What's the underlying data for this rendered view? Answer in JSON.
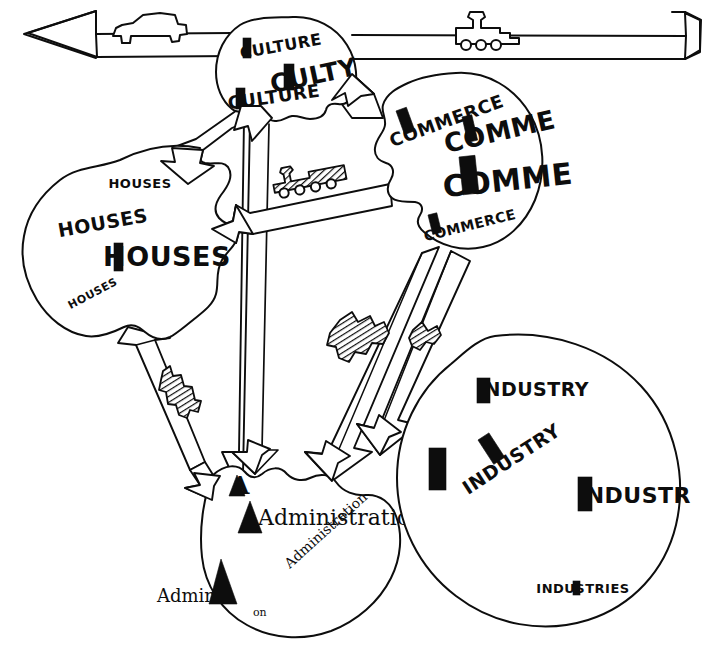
{
  "diagram": {
    "medium": "pen sketch",
    "background_color": "#ffffff",
    "ink_color": "#0d0d0d",
    "canvas": {
      "width": 706,
      "height": 666
    }
  },
  "transport_axis": {
    "name": "horizontal double-headed arrow band",
    "direction": "bidirectional",
    "left_arrow_label": "◀",
    "right_arrow_label": "▶",
    "vehicles": [
      {
        "id": "car",
        "icon": "car-icon",
        "label": "car",
        "position": "left"
      },
      {
        "id": "locomotive",
        "icon": "train-icon",
        "label": "locomotive",
        "position": "right"
      }
    ]
  },
  "zones": [
    {
      "id": "culture",
      "name": "Culture",
      "shape": "round blob",
      "labels": [
        {
          "text": "CULTURE",
          "size": "small"
        },
        {
          "text": "CULTY",
          "size": "large"
        },
        {
          "text": "CULTURE",
          "size": "medium"
        }
      ]
    },
    {
      "id": "commerce",
      "name": "Commerce",
      "shape": "round blob",
      "labels": [
        {
          "text": "COMMERCE",
          "size": "medium"
        },
        {
          "text": "COMME",
          "size": "large"
        },
        {
          "text": "COMME",
          "size": "xlarge"
        },
        {
          "text": "COMMERCE",
          "size": "small"
        }
      ]
    },
    {
      "id": "houses",
      "name": "Houses",
      "shape": "irregular blob",
      "labels": [
        {
          "text": "HOUSES",
          "size": "small"
        },
        {
          "text": "HOUSES",
          "size": "medium"
        },
        {
          "text": "HOUSES",
          "size": "large"
        },
        {
          "text": "HOUSES",
          "size": "xsmall"
        }
      ]
    },
    {
      "id": "administration",
      "name": "Administration",
      "shape": "round blob",
      "labels": [
        {
          "text": "A",
          "size": "medium"
        },
        {
          "text": "Administration",
          "size": "large"
        },
        {
          "text": "Administration",
          "size": "small"
        },
        {
          "text": "Adminis",
          "size": "medium"
        },
        {
          "text": "on",
          "size": "xsmall"
        }
      ]
    },
    {
      "id": "industry",
      "name": "Industry",
      "shape": "large round blob",
      "labels": [
        {
          "text": "INDUSTRY",
          "size": "medium"
        },
        {
          "text": "INDUSTRY",
          "size": "medium"
        },
        {
          "text": "INDUSTR",
          "size": "large"
        },
        {
          "text": "INDUSTRIES",
          "size": "small"
        }
      ]
    }
  ],
  "corridors": [
    {
      "id": "houses-culture",
      "from": "houses",
      "to": "culture",
      "arrow": "both",
      "vehicle": null
    },
    {
      "id": "culture-commerce",
      "from": "culture",
      "to": "commerce",
      "arrow": "both",
      "vehicle": null
    },
    {
      "id": "houses-commerce",
      "from": "houses",
      "to": "commerce",
      "arrow": "left",
      "vehicle": "train-hatched"
    },
    {
      "id": "culture-administration",
      "from": "culture",
      "to": "administration",
      "arrow": "down",
      "vehicle": null
    },
    {
      "id": "houses-administration",
      "from": "houses",
      "to": "administration",
      "arrow": "both",
      "vehicle": "truck-hatched"
    },
    {
      "id": "commerce-administration",
      "from": "commerce",
      "to": "administration",
      "arrow": "down",
      "vehicle": "truck-hatched"
    },
    {
      "id": "commerce-industry",
      "from": "commerce",
      "to": "industry",
      "arrow": "down",
      "vehicle": "truck-hatched"
    }
  ]
}
